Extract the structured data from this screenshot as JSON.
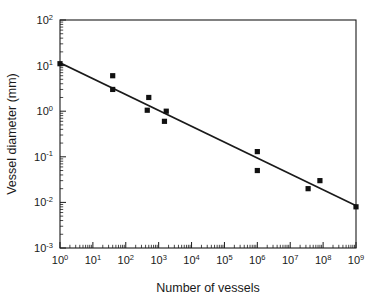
{
  "chart_data": {
    "type": "scatter",
    "title": "",
    "xlabel": "Number of vessels",
    "ylabel": "Vessel diameter (mm)",
    "xscale": "log",
    "yscale": "log",
    "xlim": [
      1,
      1000000000
    ],
    "ylim": [
      0.001,
      100
    ],
    "grid": false,
    "legend": null,
    "x_tick_labels": [
      "10⁰",
      "10¹",
      "10²",
      "10³",
      "10⁴",
      "10⁵",
      "10⁶",
      "10⁷",
      "10⁸",
      "10⁹"
    ],
    "x_tick_bases": [
      "10",
      "10",
      "10",
      "10",
      "10",
      "10",
      "10",
      "10",
      "10",
      "10"
    ],
    "x_tick_exponents": [
      "0",
      "1",
      "2",
      "3",
      "4",
      "5",
      "6",
      "7",
      "8",
      "9"
    ],
    "x_tick_values": [
      1,
      10,
      100,
      1000,
      10000,
      100000,
      1000000,
      10000000,
      100000000,
      1000000000
    ],
    "y_tick_labels": [
      "10²",
      "10¹",
      "10⁰",
      "10⁻¹",
      "10⁻²",
      "10⁻³"
    ],
    "y_tick_bases": [
      "10",
      "10",
      "10",
      "10",
      "10",
      "10"
    ],
    "y_tick_exponents": [
      "2",
      "1",
      "0",
      "-1",
      "-2",
      "-3"
    ],
    "y_tick_values": [
      100,
      10,
      1,
      0.1,
      0.01,
      0.001
    ],
    "marker_style": "filled-square",
    "marker_color": "#111111",
    "line_color": "#1a1a1a",
    "axis_color": "#1a1a1a",
    "background_color": "#ffffff",
    "points": [
      {
        "x": 1,
        "y": 11
      },
      {
        "x": 40,
        "y": 6
      },
      {
        "x": 40,
        "y": 3
      },
      {
        "x": 500,
        "y": 2
      },
      {
        "x": 450,
        "y": 1.05
      },
      {
        "x": 1700,
        "y": 1.0
      },
      {
        "x": 1500,
        "y": 0.6
      },
      {
        "x": 1000000,
        "y": 0.13
      },
      {
        "x": 1000000,
        "y": 0.05
      },
      {
        "x": 35000000,
        "y": 0.02
      },
      {
        "x": 80000000,
        "y": 0.03
      },
      {
        "x": 1000000000,
        "y": 0.008
      }
    ],
    "fit_line": {
      "x_start": 1,
      "y_start": 11.5,
      "x_end": 1000000000,
      "y_end": 0.0085,
      "slope_decades_per_decade": -0.348
    }
  }
}
